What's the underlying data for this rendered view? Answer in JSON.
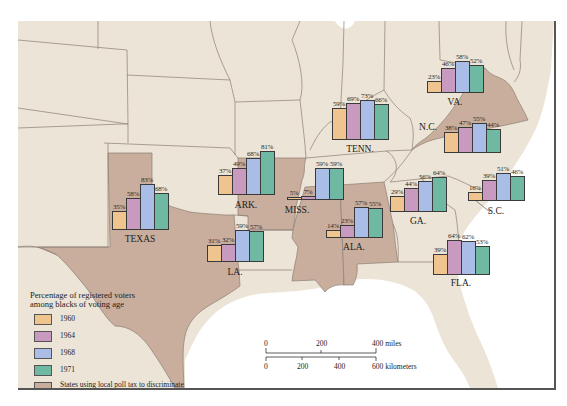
{
  "colors": {
    "y1960": "#f0c48e",
    "y1964": "#c89ac0",
    "y1968": "#a9bde6",
    "y1971": "#6fb9a3",
    "poll_tax": "#c9ad9d",
    "land": "#ece4d6",
    "water": "#ffffff",
    "border": "#8a7f74"
  },
  "legend": {
    "title_line1": "Percentage of registered voters",
    "title_line2": "among blacks of voting age",
    "items": [
      {
        "label": "1960",
        "color": "#f0c48e"
      },
      {
        "label": "1964",
        "color": "#c89ac0"
      },
      {
        "label": "1968",
        "color": "#a9bde6"
      },
      {
        "label": "1971",
        "color": "#6fb9a3"
      }
    ],
    "poll_tax_line1": "States using local poll tax to discriminate",
    "poll_tax_line2": "against black voters until 1965"
  },
  "scale_bar": {
    "miles": [
      "0",
      "200",
      "400 miles"
    ],
    "kilometers": [
      "0",
      "200",
      "400",
      "600 kilometers"
    ]
  },
  "chart_data": {
    "type": "bar",
    "title": "Percentage of registered voters among blacks of voting age",
    "categories": [
      "1960",
      "1964",
      "1968",
      "1971"
    ],
    "series": [
      {
        "name": "TEXAS",
        "values": [
          35,
          58,
          83,
          68
        ],
        "poll_tax": true
      },
      {
        "name": "ARK.",
        "values": [
          37,
          49,
          68,
          81
        ],
        "poll_tax": true
      },
      {
        "name": "LA.",
        "values": [
          31,
          32,
          59,
          57
        ],
        "poll_tax": false
      },
      {
        "name": "MISS.",
        "values": [
          5,
          7,
          59,
          59
        ],
        "poll_tax": true
      },
      {
        "name": "ALA.",
        "values": [
          14,
          23,
          57,
          55
        ],
        "poll_tax": true
      },
      {
        "name": "TENN.",
        "values": [
          59,
          69,
          73,
          66
        ],
        "poll_tax": false
      },
      {
        "name": "GA.",
        "values": [
          29,
          44,
          56,
          64
        ],
        "poll_tax": false
      },
      {
        "name": "FLA.",
        "values": [
          39,
          64,
          62,
          53
        ],
        "poll_tax": false
      },
      {
        "name": "S.C.",
        "values": [
          16,
          39,
          51,
          46
        ],
        "poll_tax": false
      },
      {
        "name": "N.C.",
        "values": [
          38,
          47,
          55,
          44
        ],
        "poll_tax": false
      },
      {
        "name": "VA.",
        "values": [
          23,
          46,
          58,
          52
        ],
        "poll_tax": true
      }
    ],
    "xlabel": "",
    "ylabel": "Percent registered",
    "ylim": [
      0,
      100
    ],
    "legend_position": "lower-left"
  },
  "charts": [
    {
      "name": "TEXAS",
      "x": 112,
      "base": 230,
      "labelY": 234,
      "labelDX": 0,
      "pct": [
        "35%",
        "58%",
        "83%",
        "68%"
      ],
      "h": [
        19,
        32,
        46,
        37
      ]
    },
    {
      "name": "ARK.",
      "x": 218,
      "base": 195,
      "labelY": 200,
      "labelDX": 0,
      "pct": [
        "37%",
        "49%",
        "68%",
        "81%"
      ],
      "h": [
        20,
        27,
        37,
        44
      ]
    },
    {
      "name": "LA.",
      "x": 207,
      "base": 262,
      "labelY": 267,
      "labelDX": 0,
      "pct": [
        "31%",
        "32%",
        "59%",
        "57%"
      ],
      "h": [
        17,
        18,
        32,
        31
      ]
    },
    {
      "name": "MISS.",
      "x": 287,
      "base": 200,
      "labelY": 205,
      "labelDX": -18,
      "pct": [
        "5%",
        "7%",
        "59%",
        "59%"
      ],
      "h": [
        3,
        4,
        32,
        32
      ]
    },
    {
      "name": "ALA.",
      "x": 326,
      "base": 238,
      "labelY": 242,
      "labelDX": 0,
      "pct": [
        "14%",
        "23%",
        "57%",
        "55%"
      ],
      "h": [
        8,
        13,
        31,
        30
      ]
    },
    {
      "name": "TENN.",
      "x": 332,
      "base": 140,
      "labelY": 144,
      "labelDX": 0,
      "pct": [
        "59%",
        "69%",
        "73%",
        "66%"
      ],
      "h": [
        32,
        37,
        40,
        36
      ]
    },
    {
      "name": "GA.",
      "x": 390,
      "base": 212,
      "labelY": 216,
      "labelDX": 0,
      "pct": [
        "29%",
        "44%",
        "56%",
        "64%"
      ],
      "h": [
        16,
        24,
        31,
        35
      ]
    },
    {
      "name": "FLA.",
      "x": 433,
      "base": 275,
      "labelY": 278,
      "labelDX": 0,
      "pct": [
        "39%",
        "64%",
        "62%",
        "53%"
      ],
      "h": [
        21,
        35,
        34,
        29
      ]
    },
    {
      "name": "S.C.",
      "x": 468,
      "base": 201,
      "labelY": 206,
      "labelDX": 0,
      "pct": [
        "16%",
        "39%",
        "51%",
        "46%"
      ],
      "h": [
        9,
        21,
        28,
        25
      ]
    },
    {
      "name": "N.C.",
      "x": 444,
      "base": 153,
      "labelY": 122,
      "labelDX": -44,
      "pct": [
        "38%",
        "47%",
        "55%",
        "44%"
      ],
      "h": [
        21,
        26,
        30,
        24
      ]
    },
    {
      "name": "VA.",
      "x": 427,
      "base": 93,
      "labelY": 97,
      "labelDX": 0,
      "pct": [
        "23%",
        "46%",
        "58%",
        "52%"
      ],
      "h": [
        12,
        25,
        32,
        28
      ]
    }
  ]
}
